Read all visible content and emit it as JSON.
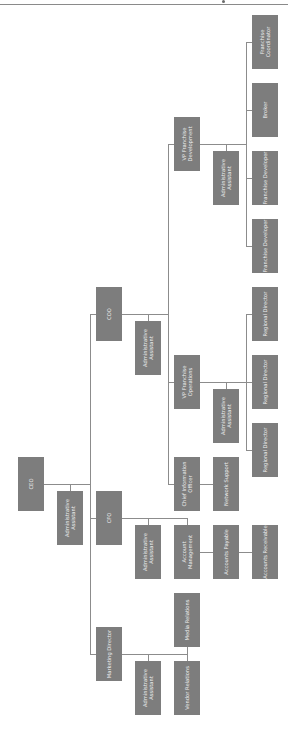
{
  "chart": {
    "orientation": "rotated-90-ccw",
    "colors": {
      "box": "#7d7d7d",
      "text": "#efefef",
      "connector": "#8c8c8c"
    },
    "nodes": {
      "ceo": "CEO",
      "ceo_admin": "Administrative Assistant",
      "coo": "COO",
      "cfo": "CFO",
      "marketing_director": "Marketing Director",
      "cfo_admin": "Administrative Assistant",
      "account_management": "Account Management",
      "accounts_payable": "Accounts Payable",
      "accounts_receivable": "Accounts Receivable",
      "media_relations": "Media Relations",
      "marketing_admin": "Administrative Assistant",
      "vendor_relations": "Vendor Relations",
      "coo_admin": "Administrative Assistant",
      "cio": "Chief Information Officer",
      "network_support": "Network Support",
      "vp_ops": "VP Franchise Operations",
      "vp_ops_admin": "Administrative Assistant",
      "regional_director_1": "Regional Director",
      "regional_director_2": "Regional Director",
      "regional_director_3": "Regional Director",
      "vp_dev": "VP Franchise Development",
      "vp_dev_admin": "Administrative Assistant",
      "franchise_developer_1": "Franchise Developer",
      "franchise_developer_2": "Franchise Developer",
      "broker": "Broker",
      "franchise_coordinator": "Franchise Coordinator"
    }
  }
}
